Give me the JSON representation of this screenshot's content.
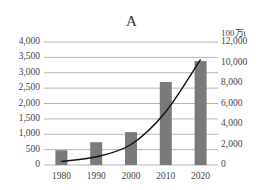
{
  "chart_data": {
    "type": "bar+line",
    "title": "A",
    "categories": [
      "1980",
      "1990",
      "2000",
      "2010",
      "2020"
    ],
    "series": [
      {
        "name": "bars (left axis)",
        "type": "bar",
        "axis": "left",
        "color": "#7a7a7a",
        "values": [
          480,
          740,
          1070,
          2700,
          3380
        ]
      },
      {
        "name": "line (right axis, 100万t)",
        "type": "line",
        "axis": "right",
        "color": "#111111",
        "values": [
          350,
          800,
          2000,
          5200,
          10300
        ]
      }
    ],
    "left_axis": {
      "label": "",
      "ylim": [
        0,
        4000
      ],
      "ticks": [
        "0",
        "500",
        "1,000",
        "1,500",
        "2,000",
        "2,500",
        "3,000",
        "3,500",
        "4,000"
      ]
    },
    "right_axis": {
      "label": "100万t",
      "ylim": [
        0,
        12000
      ],
      "ticks": [
        "0",
        "2,000",
        "4,000",
        "6,000",
        "8,000",
        "10,000",
        "12,000"
      ]
    },
    "grid": true,
    "legend": "none"
  }
}
